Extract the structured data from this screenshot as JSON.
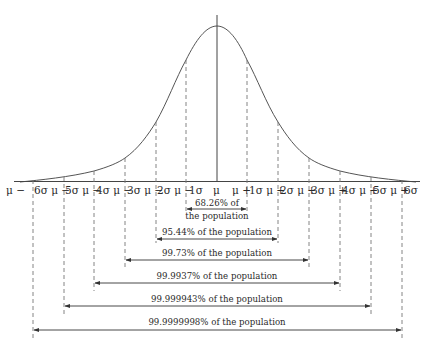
{
  "diagram": {
    "colors": {
      "curve": "#555555",
      "lines": "#444444",
      "dashes": "#777777",
      "text": "#2a2a2a"
    },
    "axis_labels": [
      {
        "id": "m6",
        "text": "μ − 6σ"
      },
      {
        "id": "m5",
        "text": "μ − 5σ"
      },
      {
        "id": "m4",
        "text": "μ − 4σ"
      },
      {
        "id": "m3",
        "text": "μ − 3σ"
      },
      {
        "id": "m2",
        "text": "μ − 2σ"
      },
      {
        "id": "m1",
        "text": "μ − 1σ"
      },
      {
        "id": "mu",
        "text": "μ"
      },
      {
        "id": "p1",
        "text": "μ + 1σ"
      },
      {
        "id": "p2",
        "text": "μ + 2σ"
      },
      {
        "id": "p3",
        "text": "μ + 3σ"
      },
      {
        "id": "p4",
        "text": "μ + 4σ"
      },
      {
        "id": "p5",
        "text": "μ + 5σ"
      },
      {
        "id": "p6",
        "text": "μ + 6σ"
      }
    ],
    "axis_fragments": {
      "f0": "μ −",
      "f1": "6σ μ −",
      "f2": "5σ μ −",
      "f3": "4σ μ −",
      "f4": "3σ μ −",
      "f5": "2σ μ −",
      "f6": "1σ",
      "f7": "μ",
      "f8": "μ +",
      "f9": "1σ μ +",
      "f10": "2σ μ +",
      "f11": "3σ μ +",
      "f12": "4σ μ +",
      "f13": "5σ μ +",
      "f14": "6σ"
    },
    "intervals": [
      {
        "sigma": 1,
        "line1": "68.26% of",
        "line2": "the population"
      },
      {
        "sigma": 2,
        "label": "95.44% of the population"
      },
      {
        "sigma": 3,
        "label": "99.73% of the population"
      },
      {
        "sigma": 4,
        "label": "99.9937% of the population"
      },
      {
        "sigma": 5,
        "label": "99.999943% of the population"
      },
      {
        "sigma": 6,
        "label": "99.9999998% of the population"
      }
    ]
  }
}
